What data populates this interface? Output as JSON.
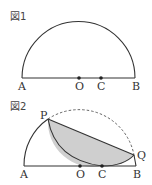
{
  "figure1": {
    "title": "図1",
    "labels": {
      "A": "A",
      "O": "O",
      "C": "C",
      "B": "B"
    }
  },
  "figure2": {
    "title": "図2",
    "labels": {
      "P": "P",
      "Q": "Q",
      "A": "A",
      "O": "O",
      "C": "C",
      "B": "B"
    }
  },
  "colors": {
    "line": "#333333",
    "shade": "#cfcfcf",
    "dashed": "#555555"
  }
}
